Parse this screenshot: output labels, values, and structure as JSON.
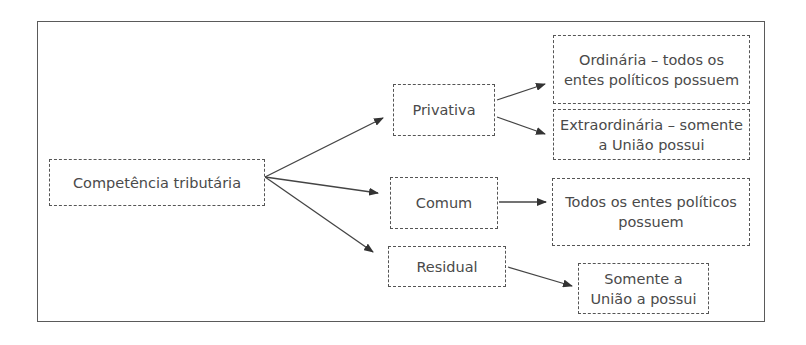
{
  "diagram": {
    "root": {
      "label": "Competência tributária"
    },
    "categories": [
      {
        "id": "privativa",
        "label": "Privativa"
      },
      {
        "id": "comum",
        "label": "Comum"
      },
      {
        "id": "residual",
        "label": "Residual"
      }
    ],
    "outcomes": [
      {
        "id": "ordinaria",
        "parent": "privativa",
        "lines": [
          "Ordinária – todos os",
          "entes políticos possuem"
        ]
      },
      {
        "id": "extraordinaria",
        "parent": "privativa",
        "lines": [
          "Extraordinária – somente",
          "a União possui"
        ]
      },
      {
        "id": "comum-outcome",
        "parent": "comum",
        "lines": [
          "Todos os entes políticos",
          "possuem"
        ]
      },
      {
        "id": "residual-outcome",
        "parent": "residual",
        "lines": [
          "Somente a",
          "União a possui"
        ]
      }
    ],
    "colors": {
      "border": "#555555",
      "text": "#4a4a4a",
      "arrow": "#333333"
    }
  }
}
